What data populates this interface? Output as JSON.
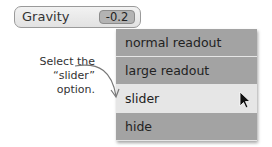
{
  "monitor": {
    "label": "Gravity",
    "value": "-0.2"
  },
  "menu": {
    "items": [
      {
        "label": "normal readout",
        "selected": false
      },
      {
        "label": "large readout",
        "selected": false
      },
      {
        "label": "slider",
        "selected": true
      },
      {
        "label": "hide",
        "selected": false
      }
    ]
  },
  "callout": {
    "line1": "Select the",
    "line2": "“slider”",
    "line3": "option."
  }
}
